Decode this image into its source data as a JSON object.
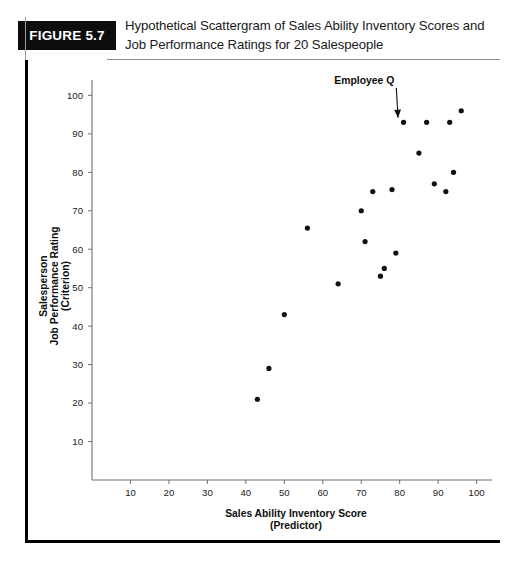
{
  "figure": {
    "badge_label": "FIGURE 5.7",
    "title_line1": "Hypothetical Scattergram of Sales Ability Inventory Scores and",
    "title_line2": "Job Performance Ratings for 20 Salespeople"
  },
  "chart_data": {
    "type": "scatter",
    "title": "Hypothetical Scattergram of Sales Ability Inventory Scores and Job Performance Ratings for 20 Salespeople",
    "xlabel": "Sales Ability Inventory Score",
    "xlabel_sub": "(Predictor)",
    "ylabel_line1": "Salesperson",
    "ylabel_line2": "Job Performance Rating",
    "ylabel_line3": "(Criterion)",
    "xlim": [
      0,
      104
    ],
    "ylim": [
      0,
      104
    ],
    "xticks": [
      10,
      20,
      30,
      40,
      50,
      60,
      70,
      80,
      90,
      100
    ],
    "yticks": [
      10,
      20,
      30,
      40,
      50,
      60,
      70,
      80,
      90,
      100
    ],
    "grid": false,
    "legend": false,
    "marker_color": "#111111",
    "n_points": 20,
    "points": [
      {
        "x": 43,
        "y": 21
      },
      {
        "x": 46,
        "y": 29
      },
      {
        "x": 50,
        "y": 43
      },
      {
        "x": 56,
        "y": 65.5
      },
      {
        "x": 64,
        "y": 51
      },
      {
        "x": 70,
        "y": 70
      },
      {
        "x": 71,
        "y": 62
      },
      {
        "x": 73,
        "y": 75
      },
      {
        "x": 75,
        "y": 53
      },
      {
        "x": 76,
        "y": 55
      },
      {
        "x": 78,
        "y": 75.5
      },
      {
        "x": 79,
        "y": 59
      },
      {
        "x": 81,
        "y": 93
      },
      {
        "x": 85,
        "y": 85
      },
      {
        "x": 87,
        "y": 93
      },
      {
        "x": 89,
        "y": 77
      },
      {
        "x": 92,
        "y": 75
      },
      {
        "x": 93,
        "y": 93
      },
      {
        "x": 94,
        "y": 80
      },
      {
        "x": 96,
        "y": 96
      }
    ],
    "annotations": [
      {
        "label": "Employee Q",
        "target_x": 81,
        "target_y": 93,
        "label_x": 63,
        "label_y": 103
      }
    ]
  }
}
